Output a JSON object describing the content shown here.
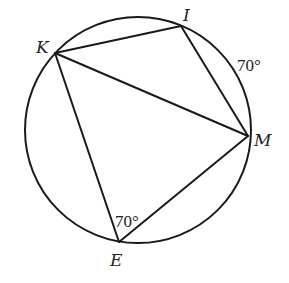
{
  "diagram": {
    "type": "inscribed-quadrilateral-in-circle",
    "colors": {
      "stroke": "#1a1a1a",
      "text": "#222222",
      "background": "#ffffff"
    },
    "circle": {
      "cx": 138,
      "cy": 130,
      "r": 113
    },
    "points": {
      "K": {
        "label": "K",
        "x": 55,
        "y": 53
      },
      "I": {
        "label": "I",
        "x": 181,
        "y": 26
      },
      "M": {
        "label": "M",
        "x": 248,
        "y": 136
      },
      "E": {
        "label": "E",
        "x": 119,
        "y": 242
      }
    },
    "segments": [
      {
        "name": "KI",
        "from": "K",
        "to": "I"
      },
      {
        "name": "IM",
        "from": "I",
        "to": "M"
      },
      {
        "name": "KM",
        "from": "K",
        "to": "M"
      },
      {
        "name": "KE",
        "from": "K",
        "to": "E"
      },
      {
        "name": "EM",
        "from": "E",
        "to": "M"
      }
    ],
    "annotations": {
      "arc_IM": {
        "text": "70°",
        "meaning": "measure of arc IM"
      },
      "angle_E": {
        "text": "70°",
        "meaning": "measure of angle KEM"
      }
    }
  }
}
